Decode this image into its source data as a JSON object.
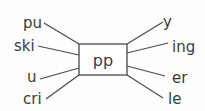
{
  "diagram": {
    "type": "word-formation-web",
    "center": {
      "text": "pp",
      "box": {
        "x": 79,
        "y": 44,
        "width": 48,
        "height": 31
      }
    },
    "left_nodes": [
      {
        "id": "pu",
        "text": "pu",
        "x": 23,
        "y": 28,
        "line": [
          44,
          23,
          79,
          44
        ]
      },
      {
        "id": "ski",
        "text": "ski",
        "x": 14,
        "y": 51,
        "line": [
          38,
          46,
          79,
          55
        ]
      },
      {
        "id": "u",
        "text": "u",
        "x": 27,
        "y": 82,
        "line": [
          40,
          79,
          79,
          68
        ]
      },
      {
        "id": "cri",
        "text": "cri",
        "x": 23,
        "y": 104,
        "line": [
          46,
          99,
          79,
          75
        ]
      }
    ],
    "right_nodes": [
      {
        "id": "y",
        "text": "y",
        "x": 163,
        "y": 27,
        "line": [
          127,
          44,
          163,
          22
        ]
      },
      {
        "id": "ing",
        "text": "ing",
        "x": 172,
        "y": 52,
        "line": [
          127,
          53,
          168,
          43
        ]
      },
      {
        "id": "er",
        "text": "er",
        "x": 172,
        "y": 83,
        "line": [
          127,
          66,
          165,
          76
        ]
      },
      {
        "id": "le",
        "text": "le",
        "x": 168,
        "y": 104,
        "line": [
          127,
          75,
          163,
          98
        ]
      }
    ],
    "colors": {
      "background": "#fdfdfc",
      "line": "#4a4a4a",
      "text": "#3a3a3a"
    }
  }
}
